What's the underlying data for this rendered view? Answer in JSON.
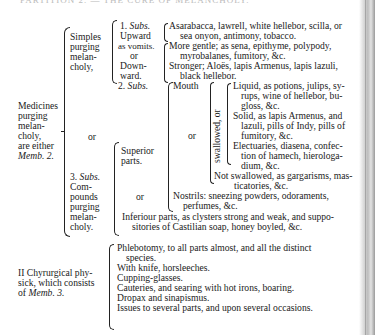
{
  "page": {
    "header_partial": "PARTITION 2. — THE CURE OF MELANCHOLY.",
    "root": {
      "label_lines": [
        "Medicines",
        "purging",
        "melan-",
        "choly,",
        "are either"
      ],
      "memb": "Memb. 2."
    },
    "simples": {
      "label_lines": [
        "Simples",
        "purging",
        "melan-",
        "choly,"
      ],
      "sub1": {
        "num": "1.",
        "subs": "Subs.",
        "lines": [
          "Upward",
          "as vomits."
        ]
      },
      "or": "or",
      "downward_lines": [
        "Down-",
        "ward."
      ],
      "upward_items": [
        [
          "Asarabacca, lawrell, white hellebor, scilla, or",
          "sea onyon, antimony, tobacco."
        ]
      ],
      "downward_items": [
        [
          "More gentle; as sena, epithyme, polypody,",
          "myrobalanes, fumitory, &c."
        ],
        [
          "Stronger; Aloës, lapis Armenus, lapis lazuli,",
          "black hellebor."
        ]
      ]
    },
    "sub2": {
      "num": "2.",
      "subs": "Subs."
    },
    "middle_or": "or",
    "compounds": {
      "num": "3.",
      "subs": "Subs.",
      "label_lines": [
        "Com-",
        "pounds",
        "purging",
        "melan-",
        "choly."
      ],
      "superior_lines": [
        "Superior",
        "parts."
      ],
      "or": "or",
      "mouth": "Mouth",
      "mouth_or": "or",
      "swallowed_label": "swallowed, or",
      "swallowed_items": [
        [
          "Liquid, as potions, julips, sy-",
          "rups, wine of hellebor, bu-",
          "gloss, &c."
        ],
        [
          "Solid, as lapis Armenus, and",
          "lazuli, pills of Indy, pills of",
          "fumitory, &c."
        ],
        [
          "Electuaries, diasena, confec-",
          "tion of hamech, hierologa-",
          "dium, &c."
        ]
      ],
      "not_swallowed": [
        "Not swallowed, as gargarisms, mas-",
        "ticatories, &c."
      ],
      "nostrils_or": "or",
      "nostrils": [
        "Nostrils: sneezing powders, odoraments,",
        "perfumes, &c."
      ],
      "inferior": [
        "Inferiour parts, as clysters strong and weak, and suppo-",
        "sitories of Castilian soap, honey boyled, &c."
      ]
    },
    "chyrurgical": {
      "label_lines": [
        "II Chyrurgical phy-",
        "sick, which consists",
        "of"
      ],
      "memb": "Memb. 3.",
      "items": [
        [
          "Phlebotomy, to all parts almost, and all the distinct",
          "species."
        ],
        [
          "With knife, horsleeches."
        ],
        [
          "Cupping-glasses."
        ],
        [
          "Cauteries, and searing with hot irons, boaring."
        ],
        [
          "Dropax and sinapismus."
        ],
        [
          "Issues to several parts, and upon several occasions."
        ]
      ]
    }
  }
}
